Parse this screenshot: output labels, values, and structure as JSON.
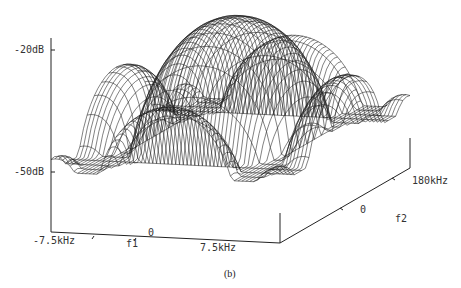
{
  "caption": "(b)",
  "chart_data": {
    "type": "surface3d",
    "title": "",
    "z_axis": {
      "label": "",
      "ticks": [
        "-20dB",
        "-50dB"
      ],
      "range_db": [
        -50,
        -20
      ]
    },
    "x_axis": {
      "label": "f1",
      "ticks": [
        "-7.5kHz",
        "0",
        "7.5kHz"
      ],
      "range_khz": [
        -7.5,
        7.5
      ]
    },
    "y_axis": {
      "label": "f2",
      "ticks": [
        "0",
        "180kHz"
      ],
      "range_khz": [
        -180,
        180
      ]
    },
    "lobes": [
      {
        "f1": 0,
        "f2": 0,
        "level_db": -20
      },
      {
        "f1": -1,
        "f2": 0,
        "level_db": -33
      },
      {
        "f1": 1,
        "f2": 0,
        "level_db": -33
      },
      {
        "f1": 0,
        "f2": -1,
        "level_db": -30
      },
      {
        "f1": 0,
        "f2": 1,
        "level_db": -30
      },
      {
        "f1": -1,
        "f2": -1,
        "level_db": -40
      },
      {
        "f1": 1,
        "f2": 1,
        "level_db": -40
      },
      {
        "f1": -1,
        "f2": 1,
        "level_db": -40
      },
      {
        "f1": 1,
        "f2": -1,
        "level_db": -40
      }
    ],
    "grid": false,
    "legend": null
  }
}
